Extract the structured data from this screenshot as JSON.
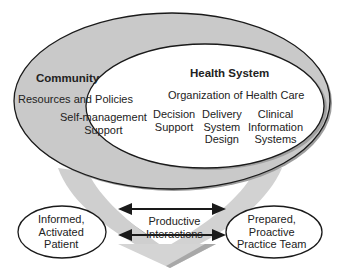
{
  "diagram": {
    "community": {
      "title": "Community",
      "items": [
        "Resources and Policies"
      ]
    },
    "health_system": {
      "title": "Health System",
      "subtitle": "Organization of Health Care",
      "items": [
        "Self-management\nSupport",
        "Decision\nSupport",
        "Delivery\nSystem\nDesign",
        "Clinical\nInformation\nSystems"
      ]
    },
    "patient": {
      "label": "Informed,\nActivated\nPatient"
    },
    "team": {
      "label": "Prepared,\nProactive\nPractice Team"
    },
    "interaction": {
      "label": "Productive\nInteractions"
    },
    "colors": {
      "community_fill": "#c9c9c9",
      "community_shadow": "#9e9e9e",
      "arrow_band": "#cfcfcf",
      "arrow_band_shadow": "#a8a8a8",
      "outline": "#1a1a1a",
      "inner_fill": "#ffffff"
    }
  }
}
